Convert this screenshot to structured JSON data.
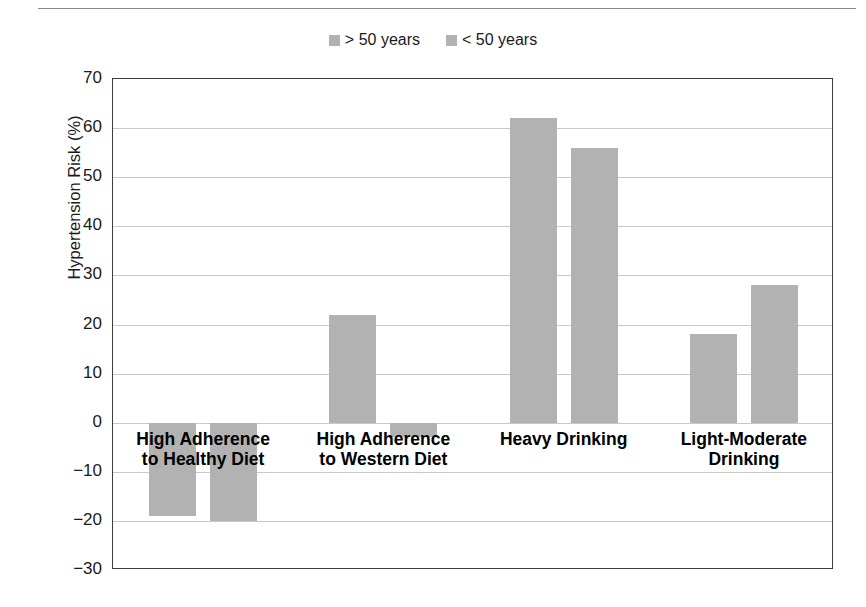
{
  "chart_data": {
    "type": "bar",
    "title": "",
    "xlabel": "",
    "ylabel": "Hypertension Risk (%)",
    "ylim": [
      -30,
      70
    ],
    "ytick_step": 10,
    "yticks": [
      70,
      60,
      50,
      40,
      30,
      20,
      10,
      0,
      "−10",
      "−20",
      "−30"
    ],
    "grid": true,
    "legend_position": "top-center",
    "bar_color": "#b2b2b2",
    "categories": [
      "High Adherence\nto Healthy Diet",
      "High Adherence\nto Western Diet",
      "Heavy Drinking",
      "Light-Moderate\nDrinking"
    ],
    "series": [
      {
        "name": "> 50 years",
        "values": [
          -19,
          22,
          62,
          18
        ],
        "color": "#b2b2b2"
      },
      {
        "name": "< 50 years",
        "values": [
          -20,
          -3,
          56,
          28
        ],
        "color": "#b2b2b2"
      }
    ]
  },
  "legend": {
    "entries": [
      {
        "label": "> 50 years",
        "swatch_color": "#b2b2b2"
      },
      {
        "label": "< 50 years",
        "swatch_color": "#b2b2b2"
      }
    ]
  },
  "axes": {
    "y_title": "Hypertension Risk (%)"
  }
}
